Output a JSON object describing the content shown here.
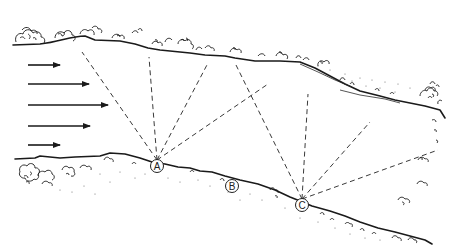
{
  "diagram": {
    "flow_arrows": [
      {
        "y": 65,
        "x1": 28,
        "x2": 60
      },
      {
        "y": 84,
        "x1": 28,
        "x2": 89
      },
      {
        "y": 105,
        "x1": 28,
        "x2": 108
      },
      {
        "y": 126,
        "x1": 28,
        "x2": 90
      },
      {
        "y": 145,
        "x1": 28,
        "x2": 60
      }
    ],
    "points": [
      {
        "id": "A",
        "label": "A",
        "x": 157,
        "y": 166
      },
      {
        "id": "B",
        "label": "B",
        "x": 232,
        "y": 186
      },
      {
        "id": "C",
        "label": "C",
        "x": 302,
        "y": 205
      }
    ],
    "sight_lines": {
      "A": [
        [
          82,
          52
        ],
        [
          149,
          57
        ],
        [
          208,
          63
        ],
        [
          268,
          84
        ]
      ],
      "C": [
        [
          236,
          65
        ],
        [
          308,
          94
        ],
        [
          370,
          122
        ],
        [
          438,
          150
        ]
      ]
    },
    "colors": {
      "ink": "#1a1a1a",
      "background": "#ffffff"
    }
  }
}
